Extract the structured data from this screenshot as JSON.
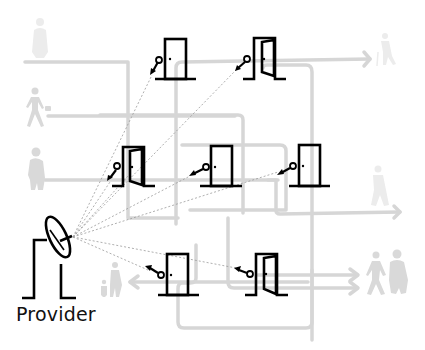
{
  "diagram": {
    "type": "access-provisioning-network",
    "provider": {
      "label": "Provider",
      "icon": "satellite-dish-icon"
    },
    "doors": [
      {
        "id": "door-1",
        "state": "closed",
        "key_direction": "incoming"
      },
      {
        "id": "door-2",
        "state": "open",
        "key_direction": "incoming"
      },
      {
        "id": "door-3",
        "state": "open",
        "key_direction": "incoming"
      },
      {
        "id": "door-4",
        "state": "closed",
        "key_direction": "incoming"
      },
      {
        "id": "door-5",
        "state": "closed",
        "key_direction": "incoming"
      },
      {
        "id": "door-6",
        "state": "closed",
        "key_direction": "outgoing"
      },
      {
        "id": "door-7",
        "state": "open",
        "key_direction": "outgoing"
      }
    ],
    "people": [
      {
        "id": "person-top-left",
        "description": "person standing"
      },
      {
        "id": "person-walking-briefcase",
        "description": "person walking with briefcase"
      },
      {
        "id": "person-heavy-left",
        "description": "person standing"
      },
      {
        "id": "person-top-right",
        "description": "person walking with cane"
      },
      {
        "id": "person-mid-right",
        "description": "person walking"
      },
      {
        "id": "person-parent-child",
        "description": "adult with child"
      },
      {
        "id": "couple-right",
        "description": "two people walking"
      }
    ],
    "colors": {
      "ink": "#000000",
      "path": "#d6d6d6",
      "people": "#d9d9d9",
      "beam": "#9a9a9a",
      "background": "#ffffff"
    }
  }
}
